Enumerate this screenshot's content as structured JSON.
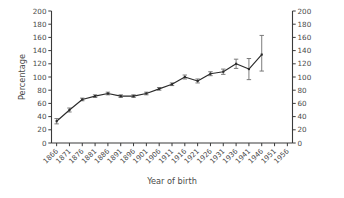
{
  "chart_data": {
    "type": "line",
    "title": "",
    "xlabel": "Year of birth",
    "ylabel": "Percentage",
    "ylim": [
      0,
      200
    ],
    "ytick_step": 20,
    "yticks": [
      0,
      20,
      40,
      60,
      80,
      100,
      120,
      140,
      160,
      180,
      200
    ],
    "ytick_labels": [
      "0",
      "20",
      "40",
      "60",
      "80",
      "100",
      "120",
      "140",
      "160",
      "180",
      "200"
    ],
    "right_axis": true,
    "right_ytick_labels": [
      "0",
      "20",
      "40",
      "60",
      "80",
      "100",
      "120",
      "140",
      "160",
      "180",
      "200"
    ],
    "xticks": [
      1866,
      1871,
      1876,
      1881,
      1886,
      1891,
      1896,
      1901,
      1906,
      1911,
      1916,
      1921,
      1926,
      1931,
      1936,
      1941,
      1946,
      1951,
      1956
    ],
    "xtick_labels": [
      "1866",
      "1871",
      "1876",
      "1881",
      "1886",
      "1891",
      "1896",
      "1901",
      "1906",
      "1911",
      "1916",
      "1921",
      "1926",
      "1931",
      "1936",
      "1941",
      "1946",
      "1951",
      "1956"
    ],
    "xlim": [
      1864,
      1958
    ],
    "grid": false,
    "legend": null,
    "error_bars": true,
    "line_color": "#2b2b2b",
    "error_color": "#6d6d6d",
    "axis_color": "#3a3a3a",
    "x": [
      1866,
      1871,
      1876,
      1881,
      1886,
      1891,
      1896,
      1901,
      1906,
      1911,
      1916,
      1921,
      1926,
      1931,
      1936,
      1941,
      1946
    ],
    "values": [
      33,
      50,
      66,
      71,
      75,
      71,
      71,
      75,
      82,
      89,
      100,
      94,
      105,
      108,
      120,
      112,
      134
    ],
    "err_low": [
      29,
      47,
      64,
      69,
      73,
      69,
      69,
      73,
      80,
      87,
      97,
      91,
      102,
      104,
      113,
      96,
      109
    ],
    "err_high": [
      37,
      53,
      68,
      73,
      77,
      73,
      73,
      77,
      84,
      91,
      103,
      97,
      108,
      112,
      127,
      128,
      163
    ],
    "series": [
      {
        "name": "Percentage",
        "values": [
          33,
          50,
          66,
          71,
          75,
          71,
          71,
          75,
          82,
          89,
          100,
          94,
          105,
          108,
          120,
          112,
          134
        ]
      }
    ]
  }
}
